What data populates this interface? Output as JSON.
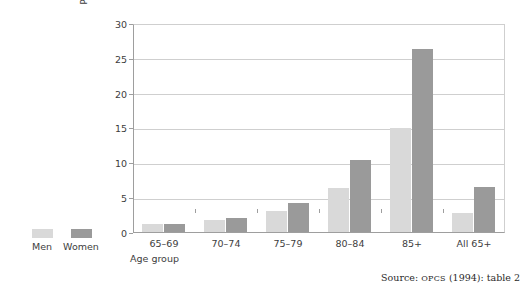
{
  "chart_data": {
    "type": "bar",
    "title": "",
    "subtitle": "",
    "xlabel": "Age group",
    "ylabel": "Per cent",
    "categories": [
      "65–69",
      "70–74",
      "75–79",
      "80–84",
      "85+",
      "All 65+"
    ],
    "series": [
      {
        "name": "Men",
        "color": "#d9d9d9",
        "values": [
          1.2,
          1.7,
          3.0,
          6.3,
          15.0,
          2.8
        ]
      },
      {
        "name": "Women",
        "color": "#9a9a9a",
        "values": [
          1.2,
          2.0,
          4.2,
          10.4,
          26.2,
          6.4
        ]
      }
    ],
    "ylim": [
      0,
      30
    ],
    "ytick_labels": [
      "30",
      "25",
      "20",
      "15",
      "10",
      "5",
      "0"
    ],
    "ytick_values": [
      30,
      25,
      20,
      15,
      10,
      5,
      0
    ],
    "grid": "horizontal",
    "legend_position": "bottom-left-outside"
  },
  "source": {
    "prefix": "Source: ",
    "organisation": "OPCS",
    "suffix": " (1994): table  2"
  }
}
